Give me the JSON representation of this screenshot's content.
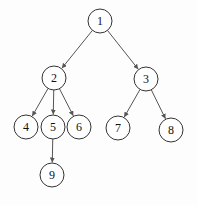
{
  "diagram": {
    "type": "tree",
    "node_radius": 12,
    "colors": {
      "stroke": "#333333",
      "edge": "#555555",
      "text": "#111111",
      "background": "#fdfdfd"
    },
    "nodes": [
      {
        "id": "1",
        "label": "1",
        "x": 100,
        "y": 21
      },
      {
        "id": "2",
        "label": "2",
        "x": 54,
        "y": 78
      },
      {
        "id": "3",
        "label": "3",
        "x": 146,
        "y": 79
      },
      {
        "id": "4",
        "label": "4",
        "x": 26,
        "y": 127
      },
      {
        "id": "5",
        "label": "5",
        "x": 53,
        "y": 127
      },
      {
        "id": "6",
        "label": "6",
        "x": 79,
        "y": 127
      },
      {
        "id": "7",
        "label": "7",
        "x": 118,
        "y": 128
      },
      {
        "id": "8",
        "label": "8",
        "x": 171,
        "y": 130
      },
      {
        "id": "9",
        "label": "9",
        "x": 52,
        "y": 175
      }
    ],
    "edges": [
      {
        "from": "1",
        "to": "2"
      },
      {
        "from": "1",
        "to": "3"
      },
      {
        "from": "2",
        "to": "4"
      },
      {
        "from": "2",
        "to": "5"
      },
      {
        "from": "2",
        "to": "6"
      },
      {
        "from": "3",
        "to": "7"
      },
      {
        "from": "3",
        "to": "8"
      },
      {
        "from": "5",
        "to": "9"
      }
    ]
  }
}
